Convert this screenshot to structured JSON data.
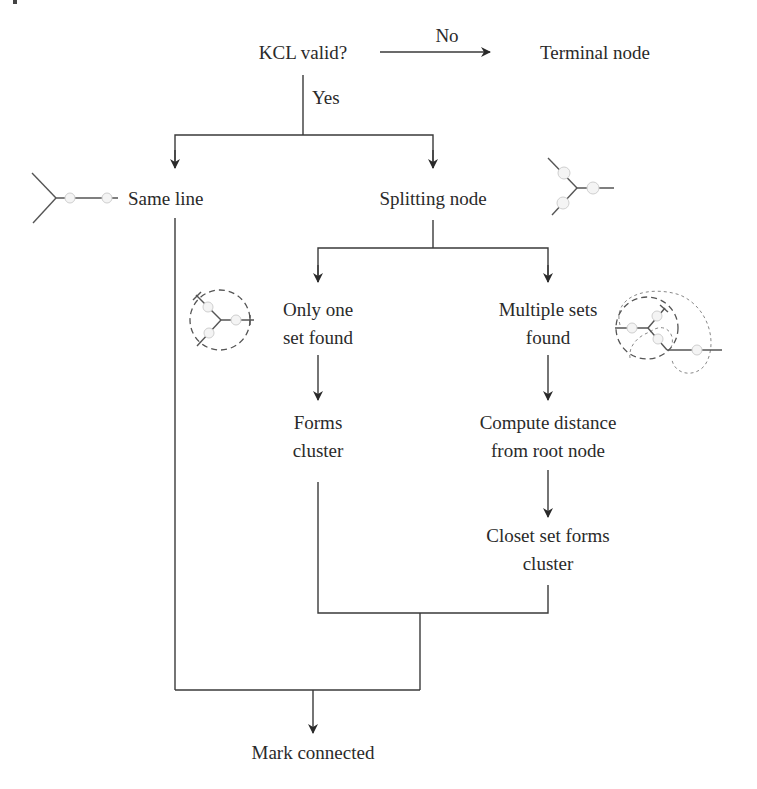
{
  "diagram": {
    "type": "flowchart",
    "nodes": {
      "kcl_valid": "KCL valid?",
      "terminal_node": "Terminal node",
      "same_line": "Same line",
      "splitting_node": "Splitting node",
      "only_one_line1": "Only one",
      "only_one_line2": "set found",
      "multiple_line1": "Multiple sets",
      "multiple_line2": "found",
      "forms_cluster_line1": "Forms",
      "forms_cluster_line2": "cluster",
      "compute_line1": "Compute distance",
      "compute_line2": "from root node",
      "closet_line1": "Closet set forms",
      "closet_line2": "cluster",
      "mark_connected": "Mark connected"
    },
    "edge_labels": {
      "no": "No",
      "yes": "Yes"
    },
    "edges": [
      {
        "from": "KCL valid?",
        "to": "Terminal node",
        "label": "No"
      },
      {
        "from": "KCL valid?",
        "to": "Same line",
        "label": "Yes"
      },
      {
        "from": "KCL valid?",
        "to": "Splitting node",
        "label": "Yes"
      },
      {
        "from": "Splitting node",
        "to": "Only one set found"
      },
      {
        "from": "Splitting node",
        "to": "Multiple sets found"
      },
      {
        "from": "Only one set found",
        "to": "Forms cluster"
      },
      {
        "from": "Multiple sets found",
        "to": "Compute distance from root node"
      },
      {
        "from": "Compute distance from root node",
        "to": "Closet set forms cluster"
      },
      {
        "from": "Forms cluster",
        "to": "Mark connected"
      },
      {
        "from": "Closet set forms cluster",
        "to": "Mark connected"
      },
      {
        "from": "Same line",
        "to": "Mark connected"
      }
    ],
    "icons": [
      "same-line-node-icon",
      "splitting-node-icon",
      "single-set-cluster-icon",
      "multiple-sets-cluster-icon"
    ],
    "colors": {
      "line": "#3a3a3a",
      "text": "#2a2a2a",
      "node_fill": "#f4f4f4"
    }
  }
}
